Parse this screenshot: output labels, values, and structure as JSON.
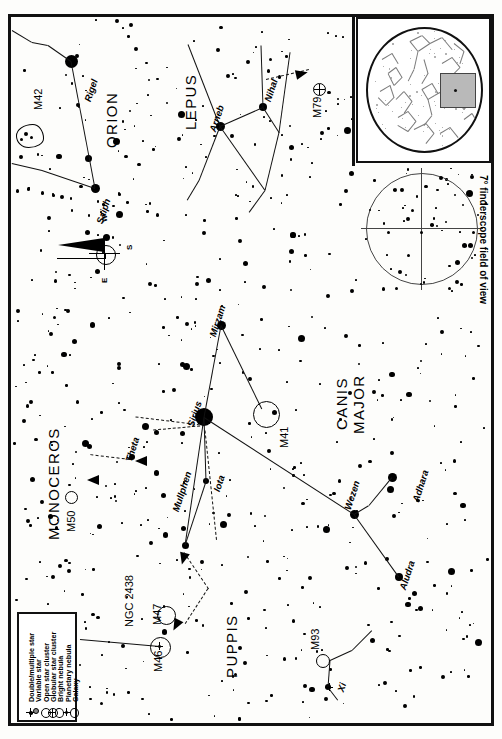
{
  "chart": {
    "finder_label": "7° finderscope field of view",
    "compass": {
      "w": "W",
      "s": "S",
      "e": "E"
    }
  },
  "constellations": [
    {
      "name": "ORION",
      "x": 104,
      "y": 148,
      "rot": -90,
      "size": 15
    },
    {
      "name": "LEPUS",
      "x": 183,
      "y": 130,
      "rot": -90,
      "size": 15
    },
    {
      "name": "CANIS",
      "x": 334,
      "y": 430,
      "rot": -90,
      "size": 15
    },
    {
      "name": "MAJOR",
      "x": 351,
      "y": 434,
      "rot": -90,
      "size": 15
    },
    {
      "name": "MONOCEROS",
      "x": 46,
      "y": 540,
      "rot": -90,
      "size": 15
    },
    {
      "name": "PUPPIS",
      "x": 224,
      "y": 678,
      "rot": -90,
      "size": 15
    }
  ],
  "star_labels": [
    {
      "name": "Rigel",
      "x": 83,
      "y": 100,
      "rot": -72
    },
    {
      "name": "Saiph",
      "x": 95,
      "y": 222,
      "rot": -72
    },
    {
      "name": "Arneb",
      "x": 208,
      "y": 130,
      "rot": -72
    },
    {
      "name": "Nihal",
      "x": 263,
      "y": 100,
      "rot": -72
    },
    {
      "name": "Mirzam",
      "x": 208,
      "y": 335,
      "rot": -72
    },
    {
      "name": "Sirius",
      "x": 186,
      "y": 425,
      "rot": -72
    },
    {
      "name": "Mullphen",
      "x": 171,
      "y": 510,
      "rot": -72
    },
    {
      "name": "Iota",
      "x": 212,
      "y": 490,
      "rot": -72
    },
    {
      "name": "Theta",
      "x": 124,
      "y": 460,
      "rot": -72
    },
    {
      "name": "Wezen",
      "x": 343,
      "y": 508,
      "rot": -72
    },
    {
      "name": "Adhara",
      "x": 411,
      "y": 500,
      "rot": -72
    },
    {
      "name": "Aludra",
      "x": 398,
      "y": 588,
      "rot": -72
    },
    {
      "name": "Xi",
      "x": 336,
      "y": 690,
      "rot": -72
    }
  ],
  "deep_sky_objects": [
    {
      "name": "M42",
      "type": "bright-nebula",
      "label_x": 33,
      "label_y": 110,
      "rot": -90
    },
    {
      "name": "M79",
      "type": "globular",
      "label_x": 312,
      "label_y": 118,
      "rot": -90
    },
    {
      "name": "M41",
      "type": "open-cluster",
      "label_x": 279,
      "label_y": 448,
      "rot": -90
    },
    {
      "name": "M50",
      "type": "open-cluster",
      "label_x": 66,
      "label_y": 532,
      "rot": -90
    },
    {
      "name": "M46",
      "type": "open-cluster",
      "label_x": 153,
      "label_y": 672,
      "rot": -90
    },
    {
      "name": "M47",
      "type": "open-cluster",
      "label_x": 152,
      "label_y": 625,
      "rot": -90
    },
    {
      "name": "M93",
      "type": "open-cluster",
      "label_x": 310,
      "label_y": 650,
      "rot": -90
    },
    {
      "name": "NGC 2438",
      "type": "planetary",
      "label_x": 124,
      "label_y": 627,
      "rot": -90
    }
  ],
  "legend": {
    "items": [
      {
        "label": "Double/multiple star",
        "symbol": "double-star-symbol"
      },
      {
        "label": "Variable star",
        "symbol": "variable-star-symbol"
      },
      {
        "label": "Open star cluster",
        "symbol": "open-cluster-symbol"
      },
      {
        "label": "Globular star cluster",
        "symbol": "globular-cluster-symbol"
      },
      {
        "label": "Bright nebula",
        "symbol": "bright-nebula-symbol"
      },
      {
        "label": "Planetary nebula",
        "symbol": "planetary-nebula-symbol"
      },
      {
        "label": "Galaxy",
        "symbol": "galaxy-symbol"
      }
    ]
  },
  "chart_data": {
    "type": "scatter",
    "xlabel": "",
    "ylabel": "",
    "legend_position": "bottom-left",
    "grid": false,
    "named_stars": [
      {
        "name": "Rigel",
        "x": 71,
        "y": 61,
        "mag_px": 13
      },
      {
        "name": "Saiph",
        "x": 95,
        "y": 188,
        "mag_px": 9
      },
      {
        "name": "Arneb",
        "x": 220,
        "y": 126,
        "mag_px": 9
      },
      {
        "name": "Nihal",
        "x": 263,
        "y": 107,
        "mag_px": 8
      },
      {
        "name": "Mirzam",
        "x": 221,
        "y": 325,
        "mag_px": 9
      },
      {
        "name": "Sirius",
        "x": 204,
        "y": 417,
        "mag_px": 18
      },
      {
        "name": "Mullphen",
        "x": 185,
        "y": 545,
        "mag_px": 7
      },
      {
        "name": "Iota",
        "x": 206,
        "y": 481,
        "mag_px": 6
      },
      {
        "name": "Theta",
        "x": 132,
        "y": 457,
        "mag_px": 6
      },
      {
        "name": "Wezen",
        "x": 354,
        "y": 514,
        "mag_px": 9
      },
      {
        "name": "Adhara",
        "x": 392,
        "y": 477,
        "mag_px": 9
      },
      {
        "name": "Aludra",
        "x": 399,
        "y": 577,
        "mag_px": 8
      },
      {
        "name": "Xi",
        "x": 328,
        "y": 687,
        "mag_px": 6
      }
    ],
    "objects": [
      {
        "name": "M42",
        "type": "bright-nebula",
        "x": 27,
        "y": 130
      },
      {
        "name": "M79",
        "type": "globular",
        "x": 318,
        "y": 90
      },
      {
        "name": "M41",
        "type": "open-cluster",
        "x": 265,
        "y": 413
      },
      {
        "name": "M50",
        "type": "open-cluster",
        "x": 71,
        "y": 497
      },
      {
        "name": "M46",
        "type": "open-cluster",
        "x": 160,
        "y": 648
      },
      {
        "name": "M47",
        "type": "open-cluster",
        "x": 165,
        "y": 615
      },
      {
        "name": "M93",
        "type": "open-cluster",
        "x": 322,
        "y": 660
      },
      {
        "name": "NGC 2438",
        "type": "planetary",
        "x": 156,
        "y": 645
      }
    ]
  }
}
